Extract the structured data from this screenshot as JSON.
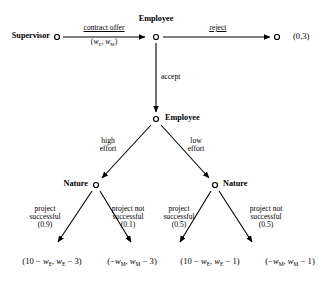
{
  "diagram": {
    "type": "extensive-form-game-tree",
    "title": "",
    "nodes": [
      {
        "id": "n0",
        "label": "Supervisor",
        "x": 156,
        "y": 37,
        "label_side": "left",
        "kind": "decision"
      },
      {
        "id": "n1",
        "label": "Employee",
        "x": 156,
        "y": 37,
        "label_side": "top",
        "kind": "decision"
      },
      {
        "id": "n2",
        "label": "",
        "x": 280,
        "y": 37,
        "label_side": "none",
        "kind": "terminal"
      },
      {
        "id": "n3",
        "label": "Employee",
        "x": 156,
        "y": 119,
        "label_side": "right",
        "kind": "decision"
      },
      {
        "id": "n4",
        "label": "Nature",
        "x": 96,
        "y": 185,
        "label_side": "left",
        "kind": "chance"
      },
      {
        "id": "n5",
        "label": "Nature",
        "x": 215,
        "y": 185,
        "label_side": "right",
        "kind": "chance"
      }
    ],
    "player_labels": {
      "supervisor": "Supervisor",
      "employee_1": "Employee",
      "employee_2": "Employee",
      "nature_left": "Nature",
      "nature_right": "Nature"
    },
    "edges": [
      {
        "from": "Supervisor",
        "to": "Employee",
        "label": "contract offer",
        "sublabel": "(wE , wM)"
      },
      {
        "from": "Employee",
        "to": "terminal-reject",
        "label": "reject"
      },
      {
        "from": "Employee",
        "to": "Employee2",
        "label": "accept"
      },
      {
        "from": "Employee2",
        "to": "Nature-left",
        "label": "high effort"
      },
      {
        "from": "Employee2",
        "to": "Nature-right",
        "label": "low effort"
      },
      {
        "from": "Nature-left",
        "to": "payoff-1",
        "label": "project successful",
        "probability": "(0.9)"
      },
      {
        "from": "Nature-left",
        "to": "payoff-2",
        "label": "project not successful",
        "probability": "(0.1)"
      },
      {
        "from": "Nature-right",
        "to": "payoff-3",
        "label": "project successful",
        "probability": "(0.5)"
      },
      {
        "from": "Nature-right",
        "to": "payoff-4",
        "label": "project not successful",
        "probability": "(0.5)"
      }
    ],
    "actions": {
      "contract_offer": "contract offer",
      "contract_offer_terms_open": "(",
      "contract_offer_w1": "w",
      "contract_offer_w1_sub": "E",
      "contract_offer_comma": ", ",
      "contract_offer_w2": "w",
      "contract_offer_w2_sub": "M",
      "contract_offer_terms_close": ")",
      "reject": "reject",
      "accept": "accept",
      "high_effort_line1": "high",
      "high_effort_line2": "effort",
      "low_effort_line1": "low",
      "low_effort_line2": "effort",
      "project_successful_line1": "project",
      "project_successful_line2": "successful",
      "project_not_successful_line1": "project not",
      "project_not_successful_line2": "successful"
    },
    "probabilities": {
      "high_success": "(0.9)",
      "high_failure": "(0.1)",
      "low_success": "(0.5)",
      "low_failure": "(0.5)"
    },
    "payoffs": {
      "reject": "(0,3)",
      "high_success": {
        "open": "(",
        "first_const": "10 − ",
        "first_var": "w",
        "first_sub": "E",
        "comma": ", ",
        "second_var": "w",
        "second_sub": "E",
        "second_tail": " − 3",
        "close": ")"
      },
      "high_failure": {
        "open": "(",
        "first_const": "−",
        "first_var": "w",
        "first_sub": "M",
        "comma": ", ",
        "second_var": "w",
        "second_sub": "M",
        "second_tail": " − 3",
        "close": ")"
      },
      "low_success": {
        "open": "(",
        "first_const": "10 − ",
        "first_var": "w",
        "first_sub": "E",
        "comma": ", ",
        "second_var": "w",
        "second_sub": "E",
        "second_tail": " − 1",
        "close": ")"
      },
      "low_failure": {
        "open": "(",
        "first_const": "−",
        "first_var": "w",
        "first_sub": "M",
        "comma": ", ",
        "second_var": "w",
        "second_sub": "M",
        "second_tail": " − 1",
        "close": ")"
      }
    },
    "colors": {
      "line": "#000000",
      "text": "#000000",
      "background": "#ffffff",
      "node_fill": "#ffffff"
    }
  }
}
